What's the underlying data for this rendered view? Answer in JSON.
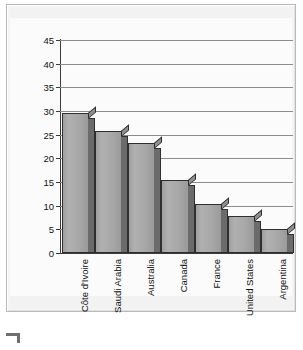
{
  "chart_data": {
    "type": "bar",
    "title": "",
    "xlabel": "",
    "ylabel": "Migrant population (percentage of total population)",
    "ylim": [
      0,
      45
    ],
    "yticks": [
      0,
      5,
      10,
      15,
      20,
      25,
      30,
      35,
      40,
      45
    ],
    "ytick_labels": [
      "0",
      "5",
      "10",
      "15",
      "20",
      "25",
      "30",
      "35",
      "40",
      "45"
    ],
    "grid": "horizontal",
    "legend": "none",
    "categories": [
      "Côte d'Ivoire",
      "Saudi Arabia",
      "Australia",
      "Canada",
      "France",
      "United States",
      "Argentina"
    ],
    "values": [
      29.5,
      25.8,
      23.3,
      15.5,
      10.4,
      7.9,
      5.1
    ],
    "bar_style": "3d-shaded-grey",
    "colors": {
      "bar_face": "#a8a8a8",
      "bar_side": "#6b6b6b",
      "bar_outline": "#2f2f2f",
      "gridline": "#8c8c8c",
      "axis": "#3a3a3a",
      "plot_background": "#fbfbfb",
      "frame_background": "#f4f4f4",
      "text": "#111111"
    }
  },
  "figure": {
    "axis_title": "Migrant population (percentage of total population)",
    "corner_mark": "crop-corner-mark"
  }
}
